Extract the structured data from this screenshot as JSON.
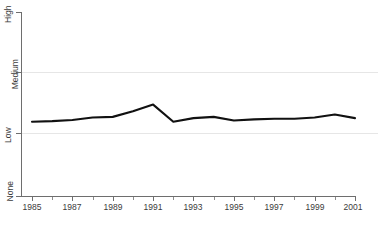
{
  "chart_data": {
    "type": "line",
    "title": "",
    "subtitle": "",
    "xlabel": "",
    "ylabel": "",
    "grid": true,
    "legend": false,
    "legend_position": "none",
    "line_color": "#111111",
    "gridline_color": "#e6e6e6",
    "axis_color": "#6e6e6e",
    "background_color": "#ffffff",
    "x": [
      1985,
      1986,
      1987,
      1988,
      1989,
      1990,
      1991,
      1992,
      1993,
      1994,
      1995,
      1996,
      1997,
      1998,
      1999,
      2000,
      2001
    ],
    "xlim": [
      1985,
      2001
    ],
    "x_tick_labels": [
      "1985",
      "1987",
      "1989",
      "1991",
      "1993",
      "1995",
      "1997",
      "1999",
      "2001"
    ],
    "x_tick_values": [
      1985,
      1987,
      1989,
      1991,
      1993,
      1995,
      1997,
      1999,
      2001
    ],
    "x_minor_tick_values": [
      1986,
      1988,
      1990,
      1992,
      1994,
      1996,
      1998,
      2000
    ],
    "y_tick_labels": [
      "None",
      "Low",
      "Medium",
      "High"
    ],
    "y_tick_values": [
      0,
      1,
      2,
      3
    ],
    "ylim": [
      0,
      3
    ],
    "y_axis_type": "ordinal",
    "series": [
      {
        "name": "series-1",
        "values": [
          1.21,
          1.22,
          1.24,
          1.28,
          1.29,
          1.38,
          1.49,
          1.21,
          1.27,
          1.29,
          1.23,
          1.25,
          1.26,
          1.26,
          1.28,
          1.33,
          1.27
        ]
      }
    ]
  }
}
